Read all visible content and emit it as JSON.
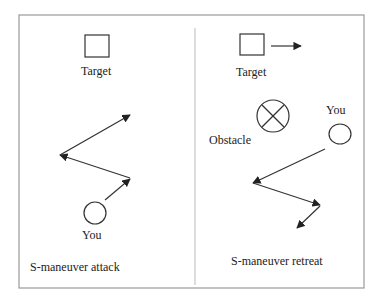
{
  "left_panel": {
    "target_label": "Target",
    "you_label": "You",
    "caption": "S-maneuver attack"
  },
  "right_panel": {
    "target_label": "Target",
    "obstacle_label": "Obstacle",
    "you_label": "You",
    "caption": "S-maneuver retreat"
  },
  "colors": {
    "stroke": "#333333",
    "border": "#999999"
  }
}
